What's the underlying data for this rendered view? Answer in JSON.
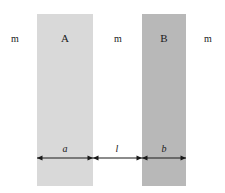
{
  "figure": {
    "canvas": {
      "width": 225,
      "height": 193,
      "background": "#ffffff"
    },
    "ink_color": "#1a1a1a"
  },
  "slabs": [
    {
      "name": "slab-a",
      "label": "A",
      "fill": "#d9d9d9",
      "x": 37,
      "y": 14,
      "width": 56,
      "height": 172,
      "label_x": 65,
      "label_y": 33
    },
    {
      "name": "slab-b",
      "label": "B",
      "fill": "#b8b8b8",
      "x": 142,
      "y": 14,
      "width": 44,
      "height": 172,
      "label_x": 164,
      "label_y": 33
    }
  ],
  "media_labels": [
    {
      "name": "medium-left",
      "label": "m",
      "x": 15,
      "y": 34
    },
    {
      "name": "medium-middle",
      "label": "m",
      "x": 118,
      "y": 34
    },
    {
      "name": "medium-right",
      "label": "m",
      "x": 208,
      "y": 34
    }
  ],
  "dimensions": [
    {
      "name": "dimension-a",
      "label": "a",
      "x1": 37,
      "x2": 93,
      "y": 158,
      "label_x": 65,
      "label_y": 144
    },
    {
      "name": "dimension-l",
      "label": "l",
      "x1": 93,
      "x2": 142,
      "y": 158,
      "label_x": 117,
      "label_y": 144
    },
    {
      "name": "dimension-b",
      "label": "b",
      "x1": 142,
      "x2": 186,
      "y": 158,
      "label_x": 164,
      "label_y": 144
    }
  ],
  "chart_data": {
    "type": "diagram",
    "title": "",
    "regions": [
      {
        "name": "m",
        "kind": "medium",
        "position": "left-of-A"
      },
      {
        "name": "A",
        "kind": "slab",
        "thickness_symbol": "a",
        "shade": "#d9d9d9"
      },
      {
        "name": "m",
        "kind": "medium",
        "position": "between-A-and-B",
        "thickness_symbol": "l"
      },
      {
        "name": "B",
        "kind": "slab",
        "thickness_symbol": "b",
        "shade": "#b8b8b8"
      },
      {
        "name": "m",
        "kind": "medium",
        "position": "right-of-B"
      }
    ],
    "symbols": [
      "m",
      "A",
      "B",
      "a",
      "l",
      "b"
    ]
  }
}
